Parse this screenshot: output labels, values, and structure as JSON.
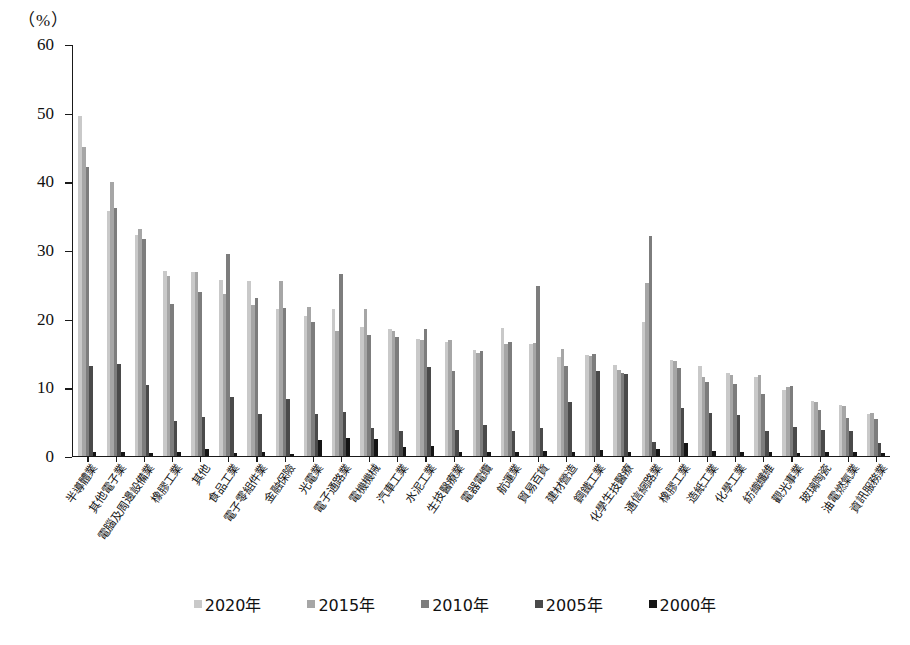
{
  "axis": {
    "unit_label": "（%）",
    "y_ticks": [
      "0",
      "10",
      "20",
      "30",
      "40",
      "50",
      "60"
    ],
    "y_min": 0,
    "y_max": 60
  },
  "legend": {
    "items": [
      {
        "label": "2020年",
        "color": "#c9c9c9"
      },
      {
        "label": "2015年",
        "color": "#a6a6a6"
      },
      {
        "label": "2010年",
        "color": "#7d7d7d"
      },
      {
        "label": "2005年",
        "color": "#4a4a4a"
      },
      {
        "label": "2000年",
        "color": "#151515"
      }
    ]
  },
  "chart_data": {
    "type": "bar",
    "title": "",
    "xlabel": "",
    "ylabel": "（%）",
    "ylim": [
      0,
      60
    ],
    "grid": false,
    "legend_position": "bottom",
    "categories": [
      "半導體業",
      "其他電子業",
      "電腦及周邊設備業",
      "橡膠工業",
      "其他",
      "食品工業",
      "電子零組件業",
      "金融保險",
      "光電業",
      "電子通路業",
      "電機機械",
      "汽車工業",
      "水泥工業",
      "生技醫療業",
      "電器電纜",
      "航運業",
      "貿易百貨",
      "建材營造",
      "鋼鐵工業",
      "化學生技醫療",
      "通信網路業",
      "橡膠工業",
      "造紙工業",
      "化學工業",
      "紡織纖維",
      "觀光事業",
      "玻璃陶瓷",
      "油電燃氣業",
      "資訊服務業"
    ],
    "series": [
      {
        "name": "2020年",
        "color": "#c9c9c9",
        "values": [
          49.5,
          35.6,
          32.1,
          26.9,
          26.8,
          25.6,
          25.5,
          21.3,
          20.3,
          21.4,
          18.7,
          18.4,
          17.0,
          16.5,
          15.4,
          18.6,
          16.3,
          14.3,
          14.6,
          13.2,
          19.4,
          13.9,
          13.1,
          12.0,
          11.5,
          9.5,
          8.0,
          7.4,
          6.0
        ]
      },
      {
        "name": "2015年",
        "color": "#a6a6a6",
        "values": [
          45.0,
          39.8,
          33.0,
          26.1,
          26.7,
          23.5,
          22.0,
          25.4,
          21.6,
          18.2,
          21.4,
          18.1,
          16.9,
          16.9,
          14.9,
          16.2,
          16.4,
          15.6,
          14.5,
          12.5,
          25.2,
          13.8,
          11.5,
          11.8,
          11.7,
          10.0,
          7.8,
          7.2,
          6.2
        ]
      },
      {
        "name": "2010年",
        "color": "#7d7d7d",
        "values": [
          42.0,
          36.0,
          31.5,
          22.1,
          23.9,
          29.4,
          22.9,
          21.5,
          19.4,
          26.4,
          17.5,
          17.3,
          18.4,
          12.3,
          15.3,
          16.5,
          24.7,
          13.0,
          14.8,
          12.1,
          32.0,
          12.7,
          10.7,
          10.5,
          9.0,
          10.2,
          6.6,
          5.5,
          5.4
        ]
      },
      {
        "name": "2005年",
        "color": "#4a4a4a",
        "values": [
          13.0,
          13.3,
          10.3,
          5.1,
          5.6,
          8.6,
          6.0,
          8.2,
          6.1,
          6.3,
          4.0,
          3.6,
          12.9,
          3.8,
          4.5,
          3.6,
          4.0,
          7.8,
          12.3,
          11.9,
          2.0,
          7.0,
          6.2,
          5.9,
          3.6,
          4.2,
          3.8,
          3.6,
          1.9
        ]
      },
      {
        "name": "2000年",
        "color": "#151515",
        "values": [
          0.6,
          0.5,
          0.4,
          0.5,
          1.0,
          0.4,
          0.5,
          0.3,
          2.3,
          2.5,
          2.4,
          1.3,
          1.4,
          0.5,
          0.5,
          0.5,
          0.7,
          0.5,
          0.8,
          0.5,
          1.0,
          1.8,
          0.7,
          0.6,
          0.5,
          0.4,
          0.5,
          0.5,
          0.4
        ]
      }
    ]
  }
}
